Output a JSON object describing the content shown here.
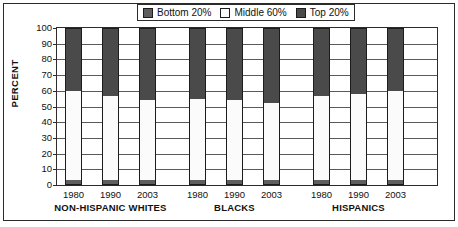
{
  "chart_data": {
    "type": "bar",
    "subtype": "stacked-bar-grouped",
    "title": "",
    "xlabel": "",
    "ylabel": "PERCENT",
    "ylim": [
      0,
      100
    ],
    "ytick_step": 10,
    "yticks": [
      100,
      90,
      80,
      70,
      60,
      50,
      40,
      30,
      20,
      10,
      0
    ],
    "grid": true,
    "grid_axis": "y",
    "legend_position": "top-center",
    "legend": [
      "Bottom 20%",
      "Middle 60%",
      "Top 20%"
    ],
    "series": [
      {
        "name": "Bottom 20%",
        "color": "#5e5e5e",
        "values": [
          3.5,
          3.5,
          3.5,
          3.5,
          3.5,
          3.5,
          3.5,
          3.5,
          3.5
        ]
      },
      {
        "name": "Middle 60%",
        "color": "#fbfbfb",
        "values": [
          56.5,
          53.5,
          50.5,
          51.5,
          50.5,
          48.5,
          53.5,
          54.5,
          56.5
        ]
      },
      {
        "name": "Top 20%",
        "color": "#4a4a4a",
        "values": [
          40.0,
          43.0,
          46.0,
          45.0,
          46.0,
          48.0,
          43.0,
          42.0,
          40.0
        ]
      }
    ],
    "categories": [
      "1980",
      "1990",
      "2003",
      "1980",
      "1990",
      "2003",
      "1980",
      "1990",
      "2003"
    ],
    "groups": [
      {
        "label": "NON-HISPANIC WHITES",
        "categories": [
          "1980",
          "1990",
          "2003"
        ]
      },
      {
        "label": "BLACKS",
        "categories": [
          "1980",
          "1990",
          "2003"
        ]
      },
      {
        "label": "HISPANICS",
        "categories": [
          "1980",
          "1990",
          "2003"
        ]
      }
    ],
    "bars": [
      {
        "group": "NON-HISPANIC WHITES",
        "category": "1980",
        "bottom": 3.5,
        "middle": 56.5,
        "top": 40.0
      },
      {
        "group": "NON-HISPANIC WHITES",
        "category": "1990",
        "bottom": 3.5,
        "middle": 53.5,
        "top": 43.0
      },
      {
        "group": "NON-HISPANIC WHITES",
        "category": "2003",
        "bottom": 3.5,
        "middle": 50.5,
        "top": 46.0
      },
      {
        "group": "BLACKS",
        "category": "1980",
        "bottom": 3.5,
        "middle": 51.5,
        "top": 45.0
      },
      {
        "group": "BLACKS",
        "category": "1990",
        "bottom": 3.5,
        "middle": 50.5,
        "top": 46.0
      },
      {
        "group": "BLACKS",
        "category": "2003",
        "bottom": 3.5,
        "middle": 48.5,
        "top": 48.0
      },
      {
        "group": "HISPANICS",
        "category": "1980",
        "bottom": 3.5,
        "middle": 53.5,
        "top": 43.0
      },
      {
        "group": "HISPANICS",
        "category": "1990",
        "bottom": 3.5,
        "middle": 54.5,
        "top": 42.0
      },
      {
        "group": "HISPANICS",
        "category": "2003",
        "bottom": 3.5,
        "middle": 56.5,
        "top": 40.0
      }
    ],
    "colors": {
      "bottom_20": "#5e5e5e",
      "middle_60": "#fbfbfb",
      "top_20": "#4a4a4a",
      "grid": "#5a5a5a",
      "frame": "#2b2b2b",
      "text": "#111111"
    }
  }
}
